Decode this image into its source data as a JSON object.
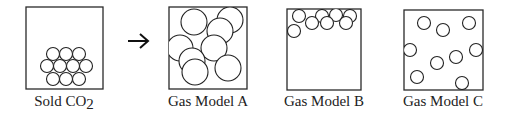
{
  "panels": [
    {
      "id": "solid",
      "label_main": "Sold CO",
      "label_sub": "2",
      "box": {
        "x": 26,
        "y": 7,
        "w": 77,
        "h": 82
      },
      "label_x": 64,
      "particle_r": 6.5,
      "particles": [
        [
          53,
          54
        ],
        [
          66,
          54
        ],
        [
          79,
          54
        ],
        [
          47,
          66
        ],
        [
          60,
          66
        ],
        [
          73,
          66
        ],
        [
          86,
          66
        ],
        [
          53,
          79
        ],
        [
          66,
          79
        ],
        [
          79,
          79
        ]
      ]
    },
    {
      "id": "gas-a",
      "label_main": "Gas Model A",
      "label_sub": "",
      "box": {
        "x": 169,
        "y": 7,
        "w": 78,
        "h": 82
      },
      "label_x": 208,
      "particle_r": 13,
      "particles": [
        [
          194,
          22
        ],
        [
          230,
          20
        ],
        [
          220,
          31
        ],
        [
          180,
          48
        ],
        [
          214,
          48
        ],
        [
          192,
          61
        ],
        [
          195,
          72
        ],
        [
          228,
          68
        ]
      ]
    },
    {
      "id": "gas-b",
      "label_main": "Gas Model B",
      "label_sub": "",
      "box": {
        "x": 287,
        "y": 9,
        "w": 74,
        "h": 81
      },
      "label_x": 324,
      "particle_r": 6.5,
      "particles": [
        [
          299,
          16
        ],
        [
          322,
          16
        ],
        [
          336,
          15
        ],
        [
          350,
          16
        ],
        [
          312,
          23
        ],
        [
          327,
          23
        ],
        [
          346,
          23
        ],
        [
          294,
          31
        ]
      ]
    },
    {
      "id": "gas-c",
      "label_main": "Gas Model C",
      "label_sub": "",
      "box": {
        "x": 404,
        "y": 10,
        "w": 79,
        "h": 80
      },
      "label_x": 443,
      "particle_r": 6.5,
      "particles": [
        [
          424,
          23
        ],
        [
          443,
          30
        ],
        [
          469,
          23
        ],
        [
          410,
          50
        ],
        [
          476,
          50
        ],
        [
          456,
          57
        ],
        [
          437,
          63
        ],
        [
          417,
          77
        ],
        [
          462,
          83
        ]
      ]
    }
  ],
  "arrow": {
    "x1": 128,
    "x2": 148,
    "y": 41,
    "glyph": "→"
  }
}
